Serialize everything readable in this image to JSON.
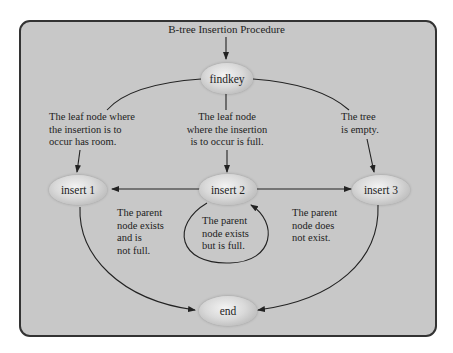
{
  "diagram": {
    "title": "B-tree Insertion Procedure",
    "colors": {
      "frame_fill": "#c8c8c8",
      "frame_border": "#333333",
      "node_highlight": "#f3f3f3",
      "node_shadow": "#a9a9a9",
      "line": "#222222"
    },
    "nodes": {
      "findkey": "findkey",
      "insert1": "insert 1",
      "insert2": "insert 2",
      "insert3": "insert 3",
      "end": "end"
    },
    "conditions": {
      "leaf_has_room": [
        "The leaf node where",
        "the insertion is to",
        "occur has room."
      ],
      "leaf_full": [
        "The leaf node",
        "where the insertion",
        "is to occur is full."
      ],
      "tree_empty": [
        "The tree",
        "is empty."
      ],
      "parent_exists_not_full": [
        "The parent",
        "node exists",
        "and is",
        "not full."
      ],
      "parent_exists_full": [
        "The parent",
        "node exists",
        "but is full."
      ],
      "parent_not_exist": [
        "The parent",
        "node does",
        "not exist."
      ]
    },
    "edges": [
      {
        "from": "title",
        "to": "findkey"
      },
      {
        "from": "findkey",
        "to": "insert1",
        "label": "leaf_has_room"
      },
      {
        "from": "findkey",
        "to": "insert2",
        "label": "leaf_full"
      },
      {
        "from": "findkey",
        "to": "insert3",
        "label": "tree_empty"
      },
      {
        "from": "insert2",
        "to": "insert1",
        "label": "parent_exists_not_full"
      },
      {
        "from": "insert2",
        "to": "insert2",
        "label": "parent_exists_full"
      },
      {
        "from": "insert2",
        "to": "insert3",
        "label": "parent_not_exist"
      },
      {
        "from": "insert1",
        "to": "end"
      },
      {
        "from": "insert3",
        "to": "end"
      }
    ]
  }
}
